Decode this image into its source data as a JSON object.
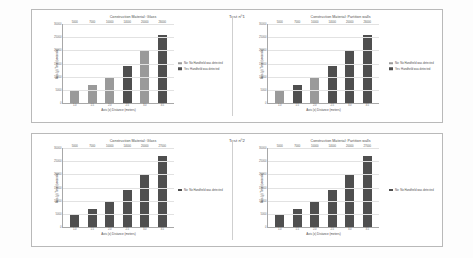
{
  "page": {
    "background": "#fdfdfd"
  },
  "colors": {
    "bar_light": "#9a9a9a",
    "bar_dark": "#4f4f4f",
    "grid": "#e2e2e2",
    "axis": "#a8a8a8",
    "panel_border": "#b9b9b9",
    "text": "#4d4d4d"
  },
  "panels": [
    {
      "test_label": "Test nº1",
      "charts": [
        {
          "chart_data": {
            "type": "bar",
            "title": "Construction Material: Glass",
            "xlabel": "Axis (x) Distance (meters)",
            "ylabel": "Axis (y) Time (seconds)",
            "categories": [
              "1.0",
              "1.5",
              "2.0",
              "2.5",
              "3.0",
              "3.5"
            ],
            "values": [
              5000,
              7000,
              10000,
              14000,
              20000,
              26000
            ],
            "data_labels": [
              "5000",
              "7000",
              "10000",
              "14000",
              "20000",
              "26000"
            ],
            "bar_colors": [
              "#9a9a9a",
              "#9a9a9a",
              "#9a9a9a",
              "#4f4f4f",
              "#9a9a9a",
              "#4f4f4f"
            ],
            "yticks": [
              "30000",
              "25000",
              "20000",
              "15000",
              "10000",
              "5000",
              "0"
            ],
            "ylim": [
              0,
              30000
            ],
            "grid": true,
            "legend_position": "right",
            "legend": [
              {
                "label": "No: No Handheld was detected",
                "color": "#9a9a9a"
              },
              {
                "label": "Yes: Handheld was detected",
                "color": "#4f4f4f"
              }
            ]
          }
        },
        {
          "chart_data": {
            "type": "bar",
            "title": "Construction Material: Partition walls",
            "xlabel": "Axis (x) Distance (meters)",
            "ylabel": "Axis (y) Time (seconds)",
            "categories": [
              "1.0",
              "1.5",
              "2.0",
              "2.5",
              "3.0",
              "3.5"
            ],
            "values": [
              5000,
              7000,
              10000,
              14000,
              20000,
              26000
            ],
            "data_labels": [
              "5000",
              "7000",
              "10000",
              "14000",
              "20000",
              "26000"
            ],
            "bar_colors": [
              "#9a9a9a",
              "#4f4f4f",
              "#9a9a9a",
              "#4f4f4f",
              "#4f4f4f",
              "#4f4f4f"
            ],
            "yticks": [
              "30000",
              "25000",
              "20000",
              "15000",
              "10000",
              "5000",
              "0"
            ],
            "ylim": [
              0,
              30000
            ],
            "grid": true,
            "legend_position": "right",
            "legend": [
              {
                "label": "No: No Handheld was detected",
                "color": "#9a9a9a"
              },
              {
                "label": "Yes: Handheld was detected",
                "color": "#4f4f4f"
              }
            ]
          }
        }
      ]
    },
    {
      "test_label": "Test nº2",
      "charts": [
        {
          "chart_data": {
            "type": "bar",
            "title": "Construction Material: Glass",
            "xlabel": "Axis (x) Distance (meters)",
            "ylabel": "Axis (y) Time (seconds)",
            "categories": [
              "1.0",
              "1.5",
              "2.0",
              "2.5",
              "3.0",
              "3.5"
            ],
            "values": [
              5000,
              7000,
              10000,
              14000,
              20000,
              27000
            ],
            "data_labels": [
              "5000",
              "7000",
              "10000",
              "14000",
              "20000",
              "27000"
            ],
            "bar_colors": [
              "#4f4f4f",
              "#4f4f4f",
              "#4f4f4f",
              "#4f4f4f",
              "#4f4f4f",
              "#4f4f4f"
            ],
            "yticks": [
              "30000",
              "25000",
              "20000",
              "15000",
              "10000",
              "5000",
              "0"
            ],
            "ylim": [
              0,
              30000
            ],
            "grid": true,
            "legend_position": "right",
            "legend": [
              {
                "label": "No: No Handheld was detected",
                "color": "#4f4f4f"
              }
            ]
          }
        },
        {
          "chart_data": {
            "type": "bar",
            "title": "Construction Material: Partition walls",
            "xlabel": "Axis (x) Distance (meters)",
            "ylabel": "Axis (y) Time (seconds)",
            "categories": [
              "1.0",
              "1.5",
              "2.0",
              "2.5",
              "3.0",
              "3.5"
            ],
            "values": [
              5000,
              7000,
              10000,
              14000,
              20000,
              27000
            ],
            "data_labels": [
              "5000",
              "7000",
              "10000",
              "14000",
              "20000",
              "27000"
            ],
            "bar_colors": [
              "#4f4f4f",
              "#4f4f4f",
              "#4f4f4f",
              "#4f4f4f",
              "#4f4f4f",
              "#4f4f4f"
            ],
            "yticks": [
              "30000",
              "25000",
              "20000",
              "15000",
              "10000",
              "5000",
              "0"
            ],
            "ylim": [
              0,
              30000
            ],
            "grid": true,
            "legend_position": "right",
            "legend": [
              {
                "label": "No: No Handheld was detected",
                "color": "#4f4f4f"
              }
            ]
          }
        }
      ]
    }
  ]
}
